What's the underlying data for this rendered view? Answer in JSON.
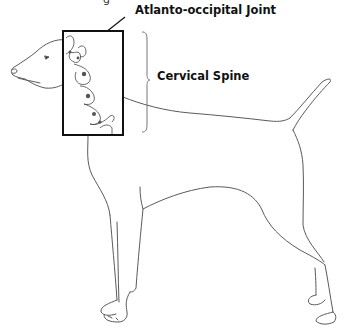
{
  "figure": {
    "cropped_top_glyph": "g",
    "labels": {
      "joint": "Atlanto-occipital Joint",
      "spine": "Cervical Spine"
    },
    "colors": {
      "outline": "#555555",
      "box": "#111111",
      "text": "#111111",
      "background": "#ffffff"
    }
  }
}
